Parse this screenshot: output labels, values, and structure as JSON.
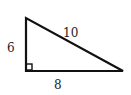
{
  "diagram": {
    "type": "right-triangle",
    "vertices": {
      "top": [
        26,
        18
      ],
      "right_angle": [
        26,
        71
      ],
      "right": [
        123,
        71
      ]
    },
    "labels": {
      "vertical_leg": "6",
      "hypotenuse": "10",
      "horizontal_leg": "8"
    },
    "right_angle_marker": true,
    "colors": {
      "stroke": "#111111",
      "text": "#222222",
      "background": "#ffffff"
    }
  }
}
